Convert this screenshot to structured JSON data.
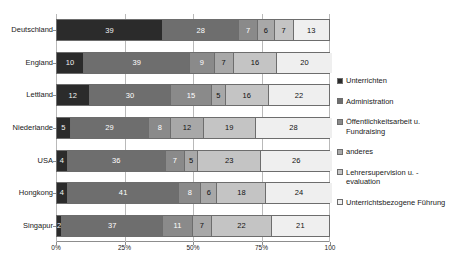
{
  "chart_data": {
    "type": "bar",
    "orientation": "horizontal",
    "stacked": true,
    "stack_mode": "percent",
    "title": "",
    "subtitle": "",
    "xlabel": "",
    "ylabel": "",
    "xlim": [
      0,
      100
    ],
    "grid": true,
    "legend_position": "right",
    "xtick_labels": [
      "0%",
      "25%",
      "50%",
      "75%",
      "100"
    ],
    "xtick_values": [
      0,
      25,
      50,
      75,
      100
    ],
    "categories": [
      "Deutschland",
      "England",
      "Lettland",
      "Niederlande",
      "USA",
      "Hongkong",
      "Singapur"
    ],
    "series": [
      {
        "name": "Unterrichten",
        "color": "#2b2b2b",
        "tone": "dark",
        "values": [
          39,
          10,
          12,
          5,
          4,
          4,
          2
        ]
      },
      {
        "name": "Administration",
        "color": "#6e6e6e",
        "tone": "midd",
        "values": [
          28,
          39,
          30,
          29,
          36,
          41,
          37
        ]
      },
      {
        "name": "Öffentlichkeitsarbeit u. Fundraising",
        "color": "#8a8a8a",
        "tone": "midd",
        "values": [
          7,
          9,
          15,
          8,
          7,
          8,
          11
        ]
      },
      {
        "name": "anderes",
        "color": "#a8a8a8",
        "tone": "light",
        "values": [
          6,
          7,
          5,
          12,
          5,
          6,
          7
        ]
      },
      {
        "name": "Lehrersupervision u. -evaluation",
        "color": "#c4c4c4",
        "tone": "light",
        "values": [
          7,
          16,
          16,
          19,
          23,
          18,
          22
        ]
      },
      {
        "name": "Unterrichtsbezogene Führung",
        "color": "#efefef",
        "tone": "light",
        "values": [
          13,
          20,
          22,
          28,
          26,
          24,
          21
        ]
      }
    ]
  },
  "legend": {
    "items": [
      {
        "label": "Unterrichten",
        "color": "#2b2b2b"
      },
      {
        "label": "Administration",
        "color": "#6e6e6e"
      },
      {
        "label": "Öffentlichkeitsarbeit u. Fundraising",
        "color": "#8a8a8a"
      },
      {
        "label": "anderes",
        "color": "#a8a8a8"
      },
      {
        "label": "Lehrersupervision u. -evaluation",
        "color": "#c4c4c4"
      },
      {
        "label": "Unterrichtsbezogene Führung",
        "color": "#efefef"
      }
    ]
  }
}
